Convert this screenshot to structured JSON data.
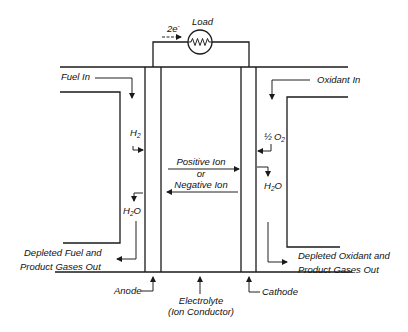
{
  "diagram": {
    "load": {
      "label": "Load",
      "electron_label": "2e",
      "electron_superscript": "-"
    },
    "left": {
      "inlet_label": "Fuel In",
      "reactant": {
        "base": "H",
        "sub": "2"
      },
      "product": {
        "base": "H",
        "sub": "2",
        "tail": "O"
      },
      "outlet_label_line1": "Depleted Fuel and",
      "outlet_label_line2": "Product Gases Out",
      "electrode_label": "Anode"
    },
    "right": {
      "inlet_label": "Oxidant In",
      "reactant": {
        "coef": "½",
        "base": "O",
        "sub": "2"
      },
      "product": {
        "base": "H",
        "sub": "2",
        "tail": "O"
      },
      "outlet_label_line1": "Depleted Oxidant and",
      "outlet_label_line2": "Product Gases Out",
      "electrode_label": "Cathode"
    },
    "center": {
      "ion_line1": "Positive Ion",
      "ion_line2": "or",
      "ion_line3": "Negative Ion",
      "electrolyte_line1": "Electrolyte",
      "electrolyte_line2": "(Ion Conductor)"
    },
    "colors": {
      "line": "#1a1a1a",
      "background": "#ffffff"
    }
  }
}
